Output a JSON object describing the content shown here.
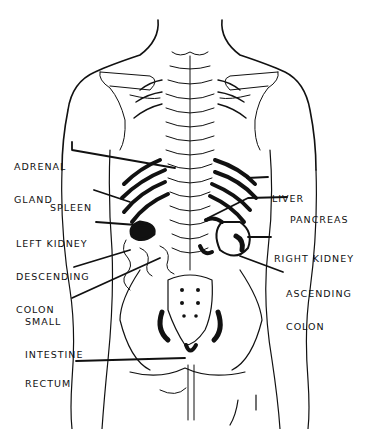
{
  "diagram": {
    "type": "anatomical-illustration",
    "colors": {
      "ink": "#111111",
      "background": "#ffffff"
    },
    "labels_left": [
      {
        "line1": "ADRENAL",
        "line2": "GLAND"
      },
      {
        "line1": "SPLEEN",
        "line2": ""
      },
      {
        "line1": "LEFT KIDNEY",
        "line2": ""
      },
      {
        "line1": "DESCENDING",
        "line2": "COLON"
      },
      {
        "line1": "SMALL",
        "line2": "INTESTINE"
      },
      {
        "line1": "RECTUM",
        "line2": ""
      }
    ],
    "labels_right": [
      {
        "line1": "LIVER",
        "line2": ""
      },
      {
        "line1": "PANCREAS",
        "line2": ""
      },
      {
        "line1": "RIGHT KIDNEY",
        "line2": ""
      },
      {
        "line1": "ASCENDING",
        "line2": "COLON"
      }
    ]
  }
}
